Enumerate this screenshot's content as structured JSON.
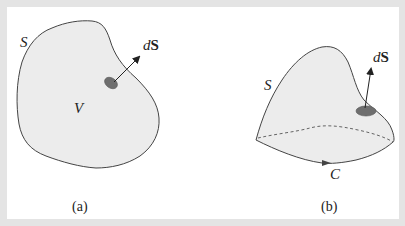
{
  "figure": {
    "panels": [
      {
        "id": "a",
        "caption": "(a)",
        "surface_label": "S",
        "volume_label": "V",
        "element_label_d": "d",
        "element_label_s": "S"
      },
      {
        "id": "b",
        "caption": "(b)",
        "surface_label": "S",
        "curve_label": "C",
        "element_label_d": "d",
        "element_label_s": "S"
      }
    ],
    "colors": {
      "fill": "#ececec",
      "outline": "#444444",
      "patch": "#6e6e6e",
      "border": "#e4e4e4",
      "background": "#ffffff"
    }
  }
}
